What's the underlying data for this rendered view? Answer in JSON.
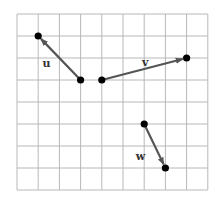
{
  "grid": {
    "columns": 9,
    "rows": 8,
    "origin_px": [
      17,
      14
    ],
    "cell_w": 21.2,
    "cell_h": 22.0,
    "line_color": "#b8b8b8"
  },
  "vectors": [
    {
      "name": "u",
      "label": "u",
      "tail": [
        3,
        3
      ],
      "head": [
        1,
        1
      ],
      "label_pos": [
        1.2,
        2.4
      ]
    },
    {
      "name": "v",
      "label": "v",
      "tail": [
        4,
        3
      ],
      "head": [
        8,
        2
      ],
      "label_pos": [
        5.9,
        2.35
      ]
    },
    {
      "name": "w",
      "label": "w",
      "tail": [
        6,
        5
      ],
      "head": [
        7,
        7
      ],
      "label_pos": [
        5.6,
        6.65
      ]
    }
  ],
  "colors": {
    "vector": "#555555",
    "point": "#000000",
    "label": "#333333"
  }
}
